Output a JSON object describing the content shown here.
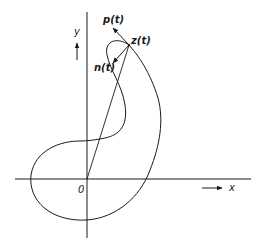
{
  "figure": {
    "labels": {
      "y_axis": "y",
      "x_axis": "x",
      "origin": "0",
      "point": "z(t)",
      "tangent_vector": "p(t)",
      "normal_vector": "n(t)"
    },
    "colors": {
      "stroke": "#1a1a1a",
      "background": "#ffffff"
    }
  }
}
